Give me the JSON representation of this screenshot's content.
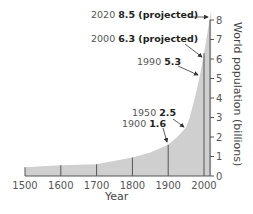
{
  "chart_data": {
    "type": "area",
    "title": "",
    "xlabel": "Year",
    "ylabel": "World population (billions)",
    "x_ticks": [
      "1500",
      "1600",
      "1700",
      "1800",
      "1900",
      "2000"
    ],
    "y_ticks": [
      "0",
      "1",
      "2",
      "3",
      "4",
      "5",
      "6",
      "7",
      "8"
    ],
    "xlim": [
      1500,
      2020
    ],
    "ylim": [
      0,
      8
    ],
    "grid": false,
    "legend": null,
    "series": [
      {
        "name": "World population",
        "x": [
          1500,
          1600,
          1700,
          1800,
          1850,
          1900,
          1925,
          1950,
          1960,
          1970,
          1980,
          1990,
          2000,
          2010,
          2020
        ],
        "values": [
          0.45,
          0.55,
          0.6,
          0.95,
          1.2,
          1.6,
          2.0,
          2.5,
          3.0,
          3.7,
          4.4,
          5.3,
          6.3,
          7.4,
          8.5
        ]
      }
    ],
    "annotations": [
      {
        "year": "2020",
        "value": "8.5",
        "note": "(projected)"
      },
      {
        "year": "2000",
        "value": "6.3",
        "note": "(projected)"
      },
      {
        "year": "1990",
        "value": "5.3",
        "note": ""
      },
      {
        "year": "1950",
        "value": "2.5",
        "note": ""
      },
      {
        "year": "1900",
        "value": "1.6",
        "note": ""
      }
    ]
  },
  "colors": {
    "area_fill": "#cfcfcf",
    "axis": "#555555",
    "text": "#555555",
    "value_text": "#222222"
  }
}
